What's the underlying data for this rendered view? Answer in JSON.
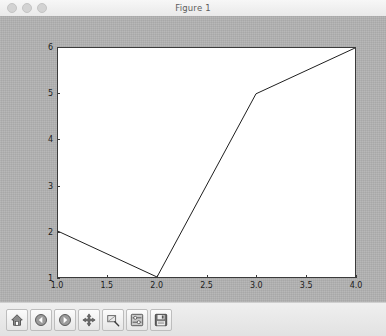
{
  "window": {
    "title": "Figure 1",
    "traffic_lights": [
      {
        "name": "close-button",
        "color": "#d3d3d3"
      },
      {
        "name": "minimize-button",
        "color": "#d3d3d3"
      },
      {
        "name": "maximize-button",
        "color": "#d3d3d3"
      }
    ]
  },
  "colors": {
    "figure_background": "#b3b3b3",
    "axes_background": "#ffffff",
    "axes_edge": "#3b3b3b",
    "line": "#1f1f1f",
    "titlebar": "#efefef",
    "toolbar": "#e6e6e6"
  },
  "toolbar": {
    "buttons": [
      {
        "name": "home-icon",
        "label": "Home",
        "tooltip": "Reset original view"
      },
      {
        "name": "back-arrow-icon",
        "label": "Back",
        "tooltip": "Back to previous view"
      },
      {
        "name": "forward-arrow-icon",
        "label": "Forward",
        "tooltip": "Forward to next view"
      },
      {
        "name": "pan-move-icon",
        "label": "Pan",
        "tooltip": "Pan axes with left mouse, zoom with right"
      },
      {
        "name": "zoom-rect-icon",
        "label": "Zoom",
        "tooltip": "Zoom to rectangle"
      },
      {
        "name": "subplots-config-icon",
        "label": "Subplots",
        "tooltip": "Configure subplots"
      },
      {
        "name": "save-floppy-icon",
        "label": "Save",
        "tooltip": "Save the figure"
      }
    ],
    "coordinate_readout": ""
  },
  "chart_data": {
    "type": "line",
    "title": "",
    "xlabel": "",
    "ylabel": "",
    "x": [
      1,
      2,
      3,
      4
    ],
    "y": [
      2,
      1,
      5,
      6
    ],
    "series": [
      {
        "name": "series-1",
        "x": [
          1,
          2,
          3,
          4
        ],
        "values": [
          2,
          1,
          5,
          6
        ],
        "color": "#1f1f1f",
        "linewidth": 1
      }
    ],
    "xlim": [
      1.0,
      4.0
    ],
    "ylim": [
      1,
      6
    ],
    "xticks": [
      1.0,
      1.5,
      2.0,
      2.5,
      3.0,
      3.5,
      4.0
    ],
    "xticklabels": [
      "1.0",
      "1.5",
      "2.0",
      "2.5",
      "3.0",
      "3.5",
      "4.0"
    ],
    "yticks": [
      1,
      2,
      3,
      4,
      5,
      6
    ],
    "yticklabels": [
      "1",
      "2",
      "3",
      "4",
      "5",
      "6"
    ],
    "grid": false,
    "legend": null,
    "legend_position": "none",
    "annotations": []
  }
}
